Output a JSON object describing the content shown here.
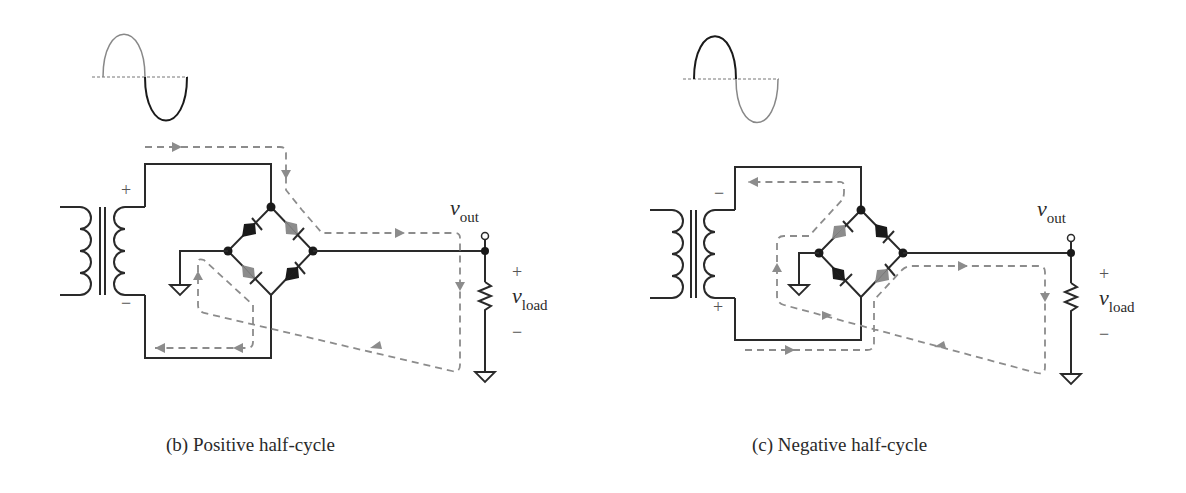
{
  "panels": [
    {
      "id": "b",
      "caption": "(b) Positive half-cycle",
      "waveform_highlight": "negative",
      "secondary_top_polarity": "+",
      "secondary_bottom_polarity": "−",
      "vout_label": "v",
      "vout_sub": "out",
      "vload_label": "v",
      "vload_sub": "load",
      "load_plus": "+",
      "load_minus": "−"
    },
    {
      "id": "c",
      "caption": "(c) Negative half-cycle",
      "waveform_highlight": "positive",
      "secondary_top_polarity": "−",
      "secondary_bottom_polarity": "+",
      "vout_label": "v",
      "vout_sub": "out",
      "vload_label": "v",
      "vload_sub": "load",
      "load_plus": "+",
      "load_minus": "−"
    }
  ],
  "colors": {
    "wire": "#2a2a2a",
    "current_path": "#8c8c8c"
  }
}
